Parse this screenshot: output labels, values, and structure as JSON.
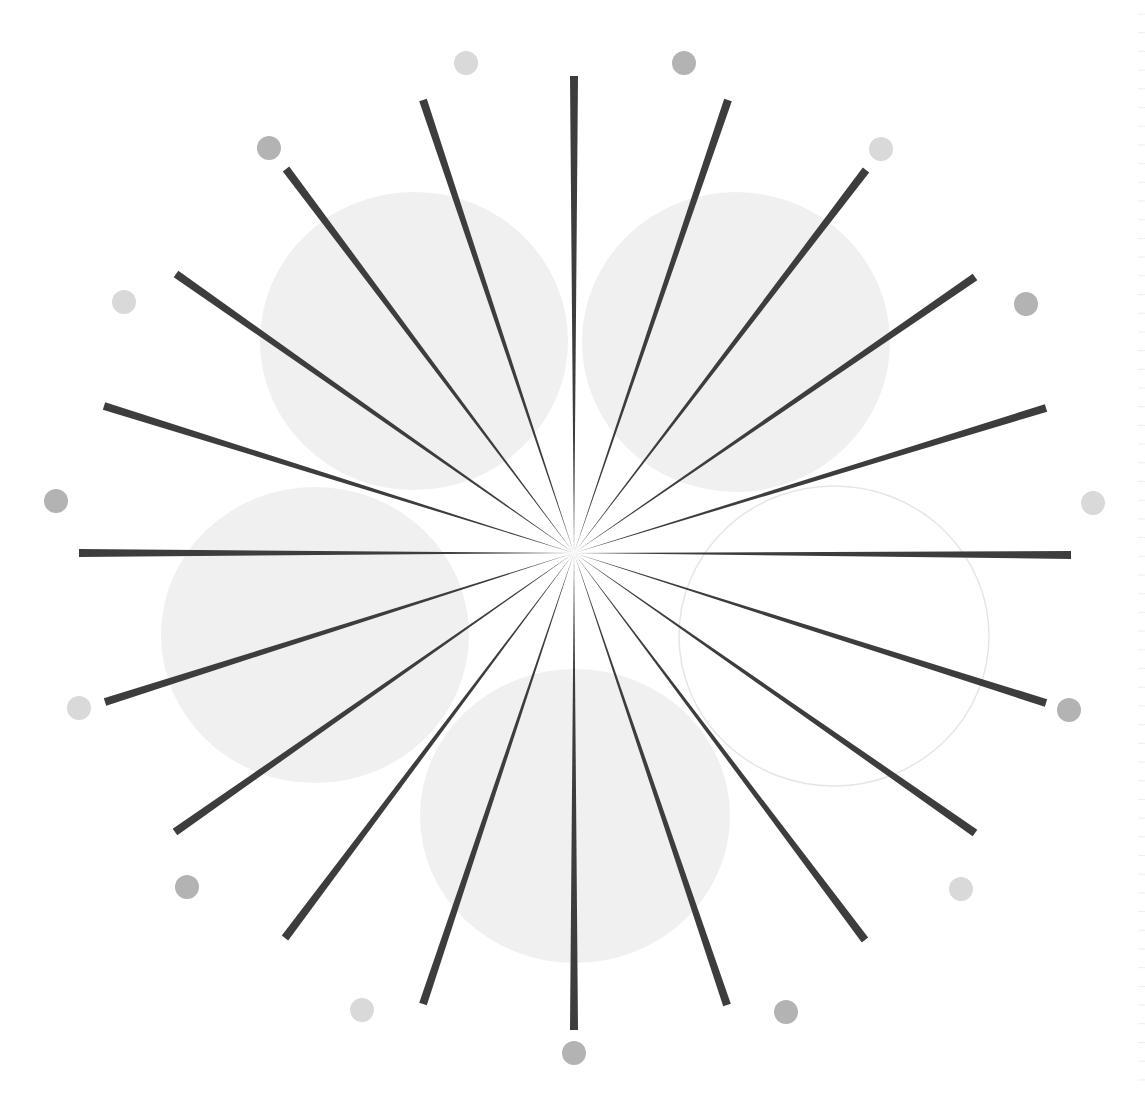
{
  "artwork": {
    "title": "Radial starburst with circles",
    "canvas": {
      "width": 1145,
      "height": 1096,
      "background": "#ffffff"
    },
    "center": {
      "x": 574,
      "y": 553
    },
    "spoke_color": "#3d3d3d",
    "spoke_outer_width": 8,
    "spokes": [
      {
        "angle": 0,
        "x": 574,
        "y": 76
      },
      {
        "angle": 15,
        "x": 728,
        "y": 100
      },
      {
        "angle": 30,
        "x": 866,
        "y": 170
      },
      {
        "angle": 45,
        "x": 975,
        "y": 277
      },
      {
        "angle": 60,
        "x": 1046,
        "y": 408
      },
      {
        "angle": 75,
        "x": 1046,
        "y": 408,
        "skip": true
      },
      {
        "angle": 90,
        "x": 1071,
        "y": 555
      },
      {
        "angle": 120,
        "x": 1046,
        "y": 703
      },
      {
        "angle": 135,
        "x": 975,
        "y": 833
      },
      {
        "angle": 150,
        "x": 865,
        "y": 940
      },
      {
        "angle": 165,
        "x": 727,
        "y": 1005
      },
      {
        "angle": 180,
        "x": 574,
        "y": 1030
      },
      {
        "angle": 195,
        "x": 423,
        "y": 1004
      },
      {
        "angle": 210,
        "x": 285,
        "y": 938
      },
      {
        "angle": 225,
        "x": 175,
        "y": 832
      },
      {
        "angle": 240,
        "x": 105,
        "y": 702
      },
      {
        "angle": 270,
        "x": 79,
        "y": 553
      },
      {
        "angle": 300,
        "x": 104,
        "y": 406
      },
      {
        "angle": 315,
        "x": 176,
        "y": 274
      },
      {
        "angle": 330,
        "x": 286,
        "y": 169
      },
      {
        "angle": 345,
        "x": 423,
        "y": 100
      }
    ],
    "dot_colors": {
      "light": "#d9d9d9",
      "dark": "#b3b3b3"
    },
    "dot_radius": 12,
    "dots": [
      {
        "x": 466,
        "y": 63,
        "tone": "light"
      },
      {
        "x": 684,
        "y": 63,
        "tone": "dark"
      },
      {
        "x": 881,
        "y": 149,
        "tone": "light"
      },
      {
        "x": 1026,
        "y": 304,
        "tone": "dark"
      },
      {
        "x": 1093,
        "y": 503,
        "tone": "light"
      },
      {
        "x": 1069,
        "y": 710,
        "tone": "dark"
      },
      {
        "x": 961,
        "y": 889,
        "tone": "light"
      },
      {
        "x": 786,
        "y": 1012,
        "tone": "dark"
      },
      {
        "x": 574,
        "y": 1053,
        "tone": "dark"
      },
      {
        "x": 362,
        "y": 1010,
        "tone": "light"
      },
      {
        "x": 187,
        "y": 887,
        "tone": "dark"
      },
      {
        "x": 79,
        "y": 708,
        "tone": "light"
      },
      {
        "x": 56,
        "y": 501,
        "tone": "dark"
      },
      {
        "x": 124,
        "y": 302,
        "tone": "light"
      },
      {
        "x": 269,
        "y": 148,
        "tone": "dark"
      }
    ],
    "circles": [
      {
        "name": "top-left",
        "cx": 414,
        "cy": 341,
        "rx": 154,
        "ry": 149,
        "fill": "#f0f0f0",
        "stroke": "none"
      },
      {
        "name": "top-right",
        "cx": 736,
        "cy": 342,
        "rx": 154,
        "ry": 150,
        "fill": "#f0f0f0",
        "stroke": "none"
      },
      {
        "name": "left",
        "cx": 315,
        "cy": 635,
        "rx": 154,
        "ry": 148,
        "fill": "#f0f0f0",
        "stroke": "none"
      },
      {
        "name": "bottom",
        "cx": 575,
        "cy": 816,
        "rx": 155,
        "ry": 147,
        "fill": "#f0f0f0",
        "stroke": "none"
      },
      {
        "name": "right-outline",
        "cx": 834,
        "cy": 636,
        "rx": 155,
        "ry": 150,
        "fill": "none",
        "stroke": "#e6e6e6"
      }
    ],
    "edge_ruler": {
      "x": 1138,
      "spacing": 18.7,
      "color": "#eeeeee"
    }
  }
}
